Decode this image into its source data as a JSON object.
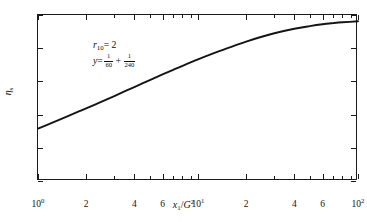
{
  "chart_data": {
    "type": "line",
    "title": "",
    "subtitle": "",
    "xlabel": "x₁/G²",
    "ylabel": "ηₛ",
    "xscale": "log",
    "yscale": "linear",
    "xlim": [
      1,
      100
    ],
    "ylim": [
      0,
      1.0
    ],
    "grid": false,
    "legend": null,
    "y_ticks": [
      "0",
      "0.2",
      "0.4",
      "0.6",
      "0.8",
      "1.0"
    ],
    "y_tick_values": [
      0,
      0.2,
      0.4,
      0.6,
      0.8,
      1.0
    ],
    "x_ticks": [
      {
        "label_main": "10",
        "label_exp": "0",
        "value": 1
      },
      {
        "label_main": "2",
        "label_exp": "",
        "value": 2
      },
      {
        "label_main": "4",
        "label_exp": "",
        "value": 4
      },
      {
        "label_main": "6",
        "label_exp": "",
        "value": 6
      },
      {
        "label_main": "10",
        "label_exp": "1",
        "value": 10
      },
      {
        "label_main": "2",
        "label_exp": "",
        "value": 20
      },
      {
        "label_main": "4",
        "label_exp": "",
        "value": 40
      },
      {
        "label_main": "6",
        "label_exp": "",
        "value": 60
      },
      {
        "label_main": "10",
        "label_exp": "2",
        "value": 100
      }
    ],
    "x_minor_ticks": [
      3,
      5,
      7,
      8,
      9,
      30,
      50,
      70,
      80,
      90
    ],
    "annotations": [
      {
        "id": "r10",
        "parts": [
          {
            "type": "italic",
            "text": "r"
          },
          {
            "type": "sub",
            "text": "10"
          },
          {
            "type": "plain",
            "text": " = 2"
          }
        ]
      },
      {
        "id": "y-expression",
        "parts": [
          {
            "type": "italic",
            "text": "y"
          },
          {
            "type": "plain",
            "text": " = "
          },
          {
            "type": "fraction",
            "num": "1",
            "den": "60"
          },
          {
            "type": "plain",
            "text": "+"
          },
          {
            "type": "fraction",
            "num": "1",
            "den": "240"
          }
        ]
      }
    ],
    "series": [
      {
        "name": "efficiency-curve",
        "color": "#141414",
        "linewidth": 1.9,
        "x": [
          1.0,
          1.2,
          1.5,
          1.8,
          2.0,
          2.5,
          3.0,
          3.5,
          4.0,
          5.0,
          6.0,
          7.0,
          8.0,
          10.0,
          12.0,
          15.0,
          20.0,
          25.0,
          30.0,
          40.0,
          50.0,
          60.0,
          70.0,
          80.0,
          100.0
        ],
        "values": [
          0.315,
          0.347,
          0.386,
          0.419,
          0.438,
          0.478,
          0.512,
          0.541,
          0.566,
          0.608,
          0.642,
          0.67,
          0.694,
          0.733,
          0.763,
          0.798,
          0.84,
          0.869,
          0.89,
          0.917,
          0.933,
          0.944,
          0.951,
          0.956,
          0.962
        ]
      }
    ]
  },
  "colors": {
    "axis": "#1a1a1a",
    "curve": "#141414",
    "text": "#111111",
    "background": "#ffffff"
  }
}
